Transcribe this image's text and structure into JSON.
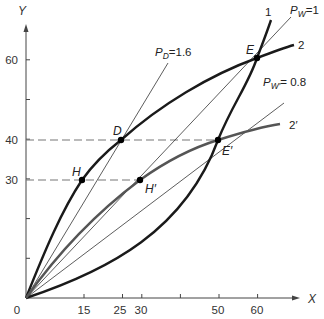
{
  "axes": {
    "x_label": "X",
    "y_label": "Y",
    "origin_label": "0",
    "x_ticks": [
      {
        "value": 15,
        "label": "15"
      },
      {
        "value": 25,
        "label": "25"
      },
      {
        "value": 30,
        "label": "30"
      },
      {
        "value": 40,
        "label": ""
      },
      {
        "value": 50,
        "label": "50"
      },
      {
        "value": 60,
        "label": "60"
      }
    ],
    "y_ticks": [
      {
        "value": 10,
        "label": ""
      },
      {
        "value": 20,
        "label": ""
      },
      {
        "value": 30,
        "label": "30"
      },
      {
        "value": 40,
        "label": "40"
      },
      {
        "value": 50,
        "label": ""
      },
      {
        "value": 60,
        "label": "60"
      }
    ]
  },
  "curves": [
    {
      "id": "1",
      "label": "1",
      "color": "#1a1a1a"
    },
    {
      "id": "2",
      "label": "2",
      "color": "#1a1a1a"
    },
    {
      "id": "2prime",
      "label": "2′",
      "color": "#555555"
    }
  ],
  "rays": [
    {
      "id": "pw1",
      "symbol": "P",
      "subscript": "W",
      "value_text": "=1",
      "slope": 1.0
    },
    {
      "id": "pd",
      "symbol": "P",
      "subscript": "D",
      "value_text": "=1.6",
      "slope": 1.6
    },
    {
      "id": "pw2",
      "symbol": "P",
      "subscript": "W′",
      "value_text": "= 0.8",
      "slope": 0.8
    }
  ],
  "points": [
    {
      "id": "E",
      "label": "E",
      "x": 60,
      "y": 60
    },
    {
      "id": "Eprime",
      "label": "E′",
      "x": 50,
      "y": 40
    },
    {
      "id": "D",
      "label": "D",
      "x": 25,
      "y": 40
    },
    {
      "id": "H",
      "label": "H",
      "x": 15,
      "y": 30
    },
    {
      "id": "Hprime",
      "label": "H′",
      "x": 30,
      "y": 30
    }
  ],
  "guides": [
    {
      "y": 40,
      "from_x": 0,
      "to_x": 50
    },
    {
      "y": 30,
      "from_x": 0,
      "to_x": 30
    }
  ],
  "colors": {
    "axis": "#444444",
    "thin_line": "#333333",
    "dash": "#777777",
    "point": "#000000"
  }
}
